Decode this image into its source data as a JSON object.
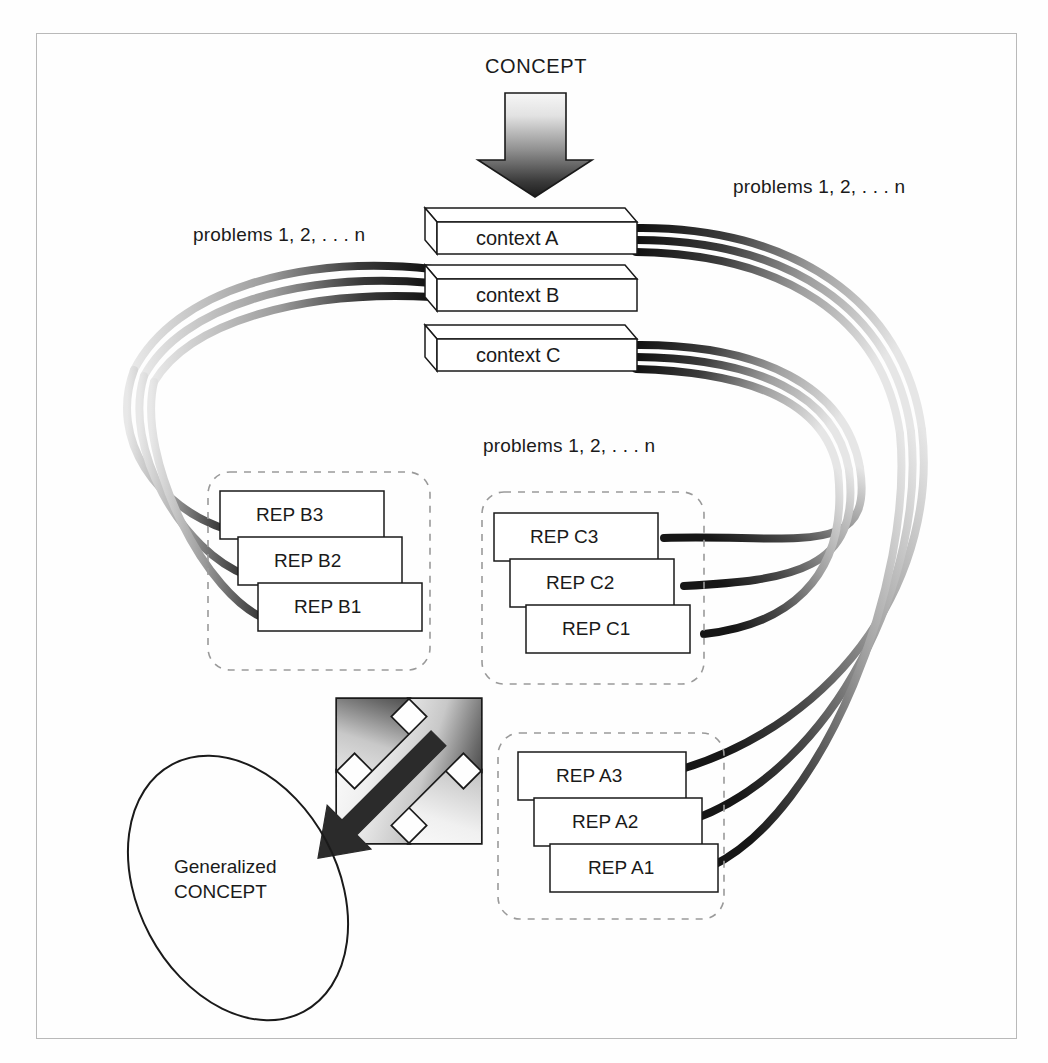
{
  "figure": {
    "border_color": "#b9b9b9",
    "background": "#fefefe",
    "ink_color": "#1a1a1a"
  },
  "labels": {
    "concept": "CONCEPT",
    "problems_left": "problems 1, 2, . . . n",
    "problems_right": "problems 1, 2, . . . n",
    "problems_middle": "problems 1, 2, . . . n",
    "generalized_line1": "Generalized",
    "generalized_line2": "CONCEPT"
  },
  "contexts": [
    {
      "id": "A",
      "label": "context A"
    },
    {
      "id": "B",
      "label": "context B"
    },
    {
      "id": "C",
      "label": "context C"
    }
  ],
  "rep_groups": [
    {
      "id": "B",
      "name": "rep-group-b",
      "boxes": [
        {
          "label": "REP B3"
        },
        {
          "label": "REP B2"
        },
        {
          "label": "REP B1"
        }
      ]
    },
    {
      "id": "C",
      "name": "rep-group-c",
      "boxes": [
        {
          "label": "REP C3"
        },
        {
          "label": "REP C2"
        },
        {
          "label": "REP C1"
        }
      ]
    },
    {
      "id": "A",
      "name": "rep-group-a",
      "boxes": [
        {
          "label": "REP A3"
        },
        {
          "label": "REP A2"
        },
        {
          "label": "REP A1"
        }
      ]
    }
  ],
  "shapes": {
    "down_arrow": {
      "name": "concept-down-arrow",
      "gradient_from": "#f2f2f2",
      "gradient_to": "#1f1f1f"
    },
    "double_arrow": {
      "name": "bidirectional-arrow",
      "gradient_from": "#fdfdfd",
      "gradient_to": "#1f1f1f"
    },
    "solid_arrow": {
      "name": "generalization-arrow",
      "fill": "#2b2b2b"
    },
    "ellipse": {
      "name": "generalized-concept-ellipse",
      "stroke": "#1a1a1a",
      "rotation_deg": -28
    },
    "curve_dark": "#1c1c1c",
    "curve_mid": "#8c8c8c",
    "curve_light": "#dcdcdc",
    "dashed_box_stroke": "#9a9a9a"
  }
}
